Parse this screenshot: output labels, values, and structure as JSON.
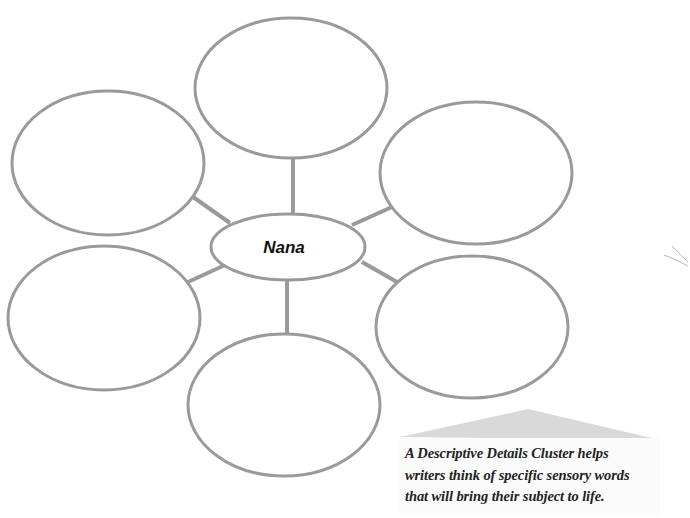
{
  "diagram": {
    "type": "descriptive-details-cluster",
    "center": {
      "label": "Nana",
      "cx": 288,
      "cy": 247,
      "rx": 77,
      "ry": 33
    },
    "nodes": [
      {
        "id": "top",
        "label": "",
        "cx": 291,
        "cy": 88,
        "rx": 96,
        "ry": 70
      },
      {
        "id": "upper-left",
        "label": "",
        "cx": 108,
        "cy": 163,
        "rx": 96,
        "ry": 72
      },
      {
        "id": "upper-right",
        "label": "",
        "cx": 476,
        "cy": 173,
        "rx": 96,
        "ry": 71
      },
      {
        "id": "lower-left",
        "label": "",
        "cx": 104,
        "cy": 318,
        "rx": 96,
        "ry": 72
      },
      {
        "id": "lower-right",
        "label": "",
        "cx": 472,
        "cy": 327,
        "rx": 96,
        "ry": 71
      },
      {
        "id": "bottom",
        "label": "",
        "cx": 284,
        "cy": 405,
        "rx": 96,
        "ry": 71
      }
    ],
    "connectors": [
      {
        "to": "top",
        "x1": 293,
        "y1": 158,
        "x2": 293,
        "y2": 214
      },
      {
        "to": "upper-left",
        "x1": 193,
        "y1": 197,
        "x2": 230,
        "y2": 223
      },
      {
        "to": "upper-right",
        "x1": 352,
        "y1": 225,
        "x2": 392,
        "y2": 207
      },
      {
        "to": "lower-left",
        "x1": 188,
        "y1": 282,
        "x2": 225,
        "y2": 265
      },
      {
        "to": "lower-right",
        "x1": 362,
        "y1": 262,
        "x2": 397,
        "y2": 282
      },
      {
        "to": "bottom",
        "x1": 287,
        "y1": 280,
        "x2": 287,
        "y2": 334
      }
    ],
    "colors": {
      "stroke": "#9a9a9a",
      "triangle": "#d9d9d9",
      "text": "#222222"
    }
  },
  "caption": {
    "lines": [
      "A Descriptive Details Cluster helps",
      "writers think of specific sensory words",
      "that will bring their subject to life."
    ]
  }
}
